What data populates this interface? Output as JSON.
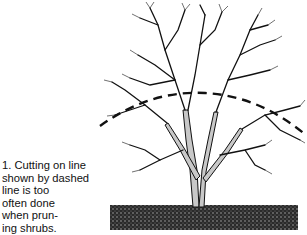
{
  "figure": {
    "number": "1.",
    "caption_lines": [
      "1. Cutting on line",
      "shown by dashed",
      "line is too",
      "often done",
      "when prun-",
      "ing shrubs."
    ],
    "caption_full": "1. Cutting on line shown by dashed line is too often done when pruning shrubs.",
    "illustration": {
      "subject": "leafless deciduous shrub with multiple stems",
      "ground": "stippled soil block",
      "cut_line": "dashed arc across upper canopy"
    }
  },
  "colors": {
    "ink": "#111111",
    "background": "#ffffff",
    "trunk_shade": "#bdbdbd"
  }
}
